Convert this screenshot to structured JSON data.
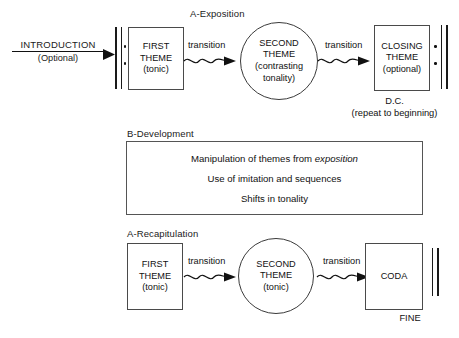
{
  "diagram": {
    "ink_color": "#1a1a1a",
    "background_color": "#ffffff"
  },
  "sections": {
    "exposition_label": "A-Exposition",
    "development_label": "B-Development",
    "recapitulation_label": "A-Recapitulation"
  },
  "intro": {
    "title": "INTRODUCTION",
    "subtitle": "(Optional)"
  },
  "exposition": {
    "first_theme": {
      "line1": "FIRST",
      "line2": "THEME",
      "line3": "(tonic)"
    },
    "transition1": "transition",
    "second_theme": {
      "line1": "SECOND",
      "line2": "THEME",
      "line3": "(contrasting",
      "line4": "tonality)"
    },
    "transition2": "transition",
    "closing_theme": {
      "line1": "CLOSING",
      "line2": "THEME",
      "line3": "(optional)"
    },
    "dc_label": "D.C.",
    "dc_note": "(repeat to beginning)"
  },
  "development": {
    "lines": [
      {
        "pre": "Manipulation of themes from ",
        "italic": "exposition",
        "post": ""
      },
      {
        "pre": "Use of imitation and sequences",
        "italic": "",
        "post": ""
      },
      {
        "pre": "Shifts in tonality",
        "italic": "",
        "post": ""
      }
    ]
  },
  "recapitulation": {
    "first_theme": {
      "line1": "FIRST",
      "line2": "THEME",
      "line3": "(tonic)"
    },
    "transition1": "transition",
    "second_theme": {
      "line1": "SECOND",
      "line2": "THEME",
      "line3": "(tonic)"
    },
    "transition2": "transition",
    "coda": {
      "line1": "CODA"
    },
    "fine_label": "FINE"
  }
}
